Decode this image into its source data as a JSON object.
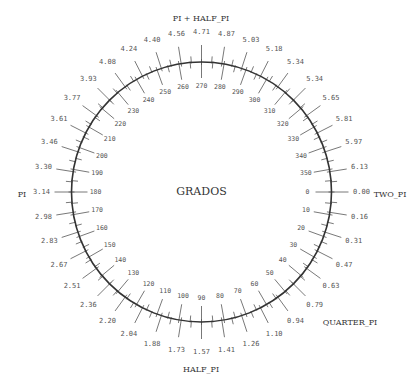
{
  "diagram": {
    "center_title": "GRADOS",
    "geometry": {
      "cx": 201.5,
      "cy": 192,
      "r": 130
    },
    "colors": {
      "circle": "#333333",
      "tick": "#555555",
      "text": "#555555"
    },
    "named_angles": [
      {
        "label": "TWO_PI",
        "deg": 0,
        "x": 390,
        "y": 195
      },
      {
        "label": "QUARTER_PI",
        "deg": 45,
        "x": 350,
        "y": 323
      },
      {
        "label": "HALF_PI",
        "deg": 90,
        "x": 201,
        "y": 370
      },
      {
        "label": "PI",
        "deg": 180,
        "x": 22,
        "y": 195
      },
      {
        "label": "PI + HALF_PI",
        "deg": 270,
        "x": 201,
        "y": 19
      }
    ],
    "degree_labels": [
      "0",
      "10",
      "20",
      "30",
      "40",
      "50",
      "60",
      "70",
      "80",
      "90",
      "100",
      "110",
      "120",
      "130",
      "140",
      "150",
      "160",
      "170",
      "180",
      "190",
      "200",
      "210",
      "220",
      "230",
      "240",
      "250",
      "260",
      "270",
      "280",
      "290",
      "300",
      "310",
      "320",
      "330",
      "340",
      "350"
    ],
    "radian_labels": [
      "0.00",
      "0.16",
      "0.31",
      "0.47",
      "0.63",
      "0.79",
      "0.94",
      "1.10",
      "1.26",
      "1.41",
      "1.57",
      "1.73",
      "1.88",
      "2.04",
      "2.20",
      "2.36",
      "2.51",
      "2.67",
      "2.83",
      "2.98",
      "3.14",
      "3.30",
      "3.46",
      "3.61",
      "3.77",
      "3.93",
      "4.08",
      "4.24",
      "4.40",
      "4.56",
      "4.71",
      "4.87",
      "5.03",
      "5.18",
      "5.34",
      "5.34",
      "5.65",
      "5.81",
      "5.97",
      "6.13"
    ]
  }
}
